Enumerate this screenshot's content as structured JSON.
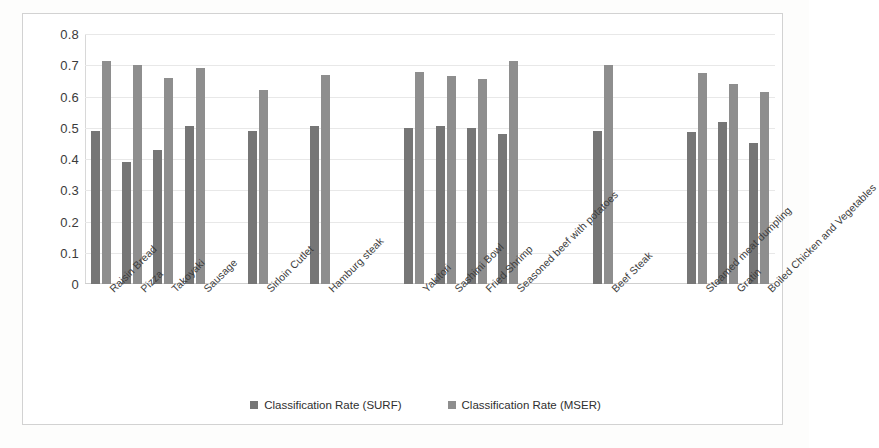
{
  "chart_data": {
    "type": "bar",
    "title": "",
    "xlabel": "",
    "ylabel": "",
    "ylim": [
      0,
      0.8
    ],
    "grid": true,
    "legend_position": "bottom",
    "ytick_labels": [
      "0.8",
      "0.7",
      "0.6",
      "0.5",
      "0.4",
      "0.3",
      "0.2",
      "0.1",
      "0"
    ],
    "ytick_values": [
      0.8,
      0.7,
      0.6,
      0.5,
      0.4,
      0.3,
      0.2,
      0.1,
      0
    ],
    "categories": [
      "Raisin Bread",
      "Pizza",
      "Takoyaki",
      "Sausage",
      "",
      "Sirloin Cutlet",
      "",
      "Hamburg steak",
      "",
      "",
      "Yakitori",
      "Sashimi Bowl",
      "Fried Shrimp",
      "Seasoned beef with potatoes",
      "",
      "",
      "Beef Steak",
      "",
      "",
      "Steamed meat dumpling",
      "Gratin",
      "Boiled Chicken and Vegetables"
    ],
    "series": [
      {
        "name": "Classification Rate (SURF)",
        "color": "#767676",
        "values": [
          0.49,
          0.39,
          0.43,
          0.505,
          null,
          0.49,
          null,
          0.505,
          null,
          null,
          0.5,
          0.505,
          0.5,
          0.48,
          null,
          null,
          0.49,
          null,
          null,
          0.485,
          0.52,
          0.45
        ]
      },
      {
        "name": "Classification Rate (MSER)",
        "color": "#8e8e8e",
        "values": [
          0.715,
          0.7,
          0.66,
          0.69,
          null,
          0.62,
          null,
          0.67,
          null,
          null,
          0.68,
          0.665,
          0.655,
          0.715,
          null,
          null,
          0.7,
          null,
          null,
          0.675,
          0.64,
          0.615
        ]
      }
    ]
  },
  "legend": {
    "entries": [
      {
        "label": "Classification Rate (SURF)"
      },
      {
        "label": "Classification Rate (MSER)"
      }
    ]
  }
}
